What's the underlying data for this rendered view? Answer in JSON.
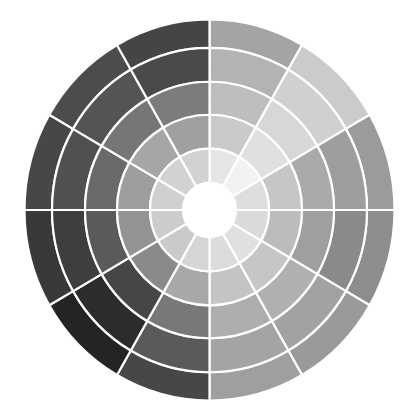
{
  "background_color": "#ffffff",
  "wheel": {
    "name": "grayscale-value-wheel",
    "center": [
      209.5,
      210
    ],
    "y_scale": 1.03,
    "ring_radii_inner_to_outer": [
      26.5,
      59.5,
      92.5,
      124.5,
      157.5,
      185
    ],
    "sector_count": 12,
    "sector_span_deg": 30,
    "start_angle_deg": 0,
    "direction": "clockwise-from-top",
    "divider_color": "#ffffff",
    "divider_width": 2.2,
    "hub_color": "#ffffff",
    "sectors": [
      {
        "from_deg": 0,
        "to_deg": 30,
        "rings_outer_to_inner": [
          "#a4a4a4",
          "#b3b3b3",
          "#bebebe",
          "#cacaca",
          "#e5e5e5"
        ]
      },
      {
        "from_deg": 30,
        "to_deg": 60,
        "rings_outer_to_inner": [
          "#cbcbcb",
          "#d0d0d0",
          "#d7d7d7",
          "#e0e0e0",
          "#f2f2f2"
        ]
      },
      {
        "from_deg": 60,
        "to_deg": 90,
        "rings_outer_to_inner": [
          "#9b9b9b",
          "#9e9e9e",
          "#aaaaaa",
          "#c6c6c6",
          "#dedede"
        ]
      },
      {
        "from_deg": 90,
        "to_deg": 120,
        "rings_outer_to_inner": [
          "#8d8d8d",
          "#8a8a8a",
          "#9f9f9f",
          "#bcbcbc",
          "#dadada"
        ]
      },
      {
        "from_deg": 120,
        "to_deg": 150,
        "rings_outer_to_inner": [
          "#9a9a9a",
          "#a2a2a2",
          "#b0b0b0",
          "#c6c6c6",
          "#e0e0e0"
        ]
      },
      {
        "from_deg": 150,
        "to_deg": 180,
        "rings_outer_to_inner": [
          "#9f9f9f",
          "#a4a4a4",
          "#aeaeae",
          "#c4c4c4",
          "#dcdcdc"
        ]
      },
      {
        "from_deg": 180,
        "to_deg": 210,
        "rings_outer_to_inner": [
          "#474747",
          "#5a5a5a",
          "#787878",
          "#a8a8a8",
          "#d6d6d6"
        ]
      },
      {
        "from_deg": 210,
        "to_deg": 240,
        "rings_outer_to_inner": [
          "#242424",
          "#2c2c2c",
          "#464646",
          "#8a8a8a",
          "#cacaca"
        ]
      },
      {
        "from_deg": 240,
        "to_deg": 270,
        "rings_outer_to_inner": [
          "#393939",
          "#3e3e3e",
          "#5a5a5a",
          "#939393",
          "#cccccc"
        ]
      },
      {
        "from_deg": 270,
        "to_deg": 300,
        "rings_outer_to_inner": [
          "#474747",
          "#505050",
          "#6a6a6a",
          "#9e9e9e",
          "#d0d0d0"
        ]
      },
      {
        "from_deg": 300,
        "to_deg": 330,
        "rings_outer_to_inner": [
          "#4c4c4c",
          "#545454",
          "#767676",
          "#a6a6a6",
          "#d2d2d2"
        ]
      },
      {
        "from_deg": 330,
        "to_deg": 360,
        "rings_outer_to_inner": [
          "#454545",
          "#4a4a4a",
          "#7c7c7c",
          "#a0a0a0",
          "#d2d2d2"
        ]
      }
    ]
  }
}
